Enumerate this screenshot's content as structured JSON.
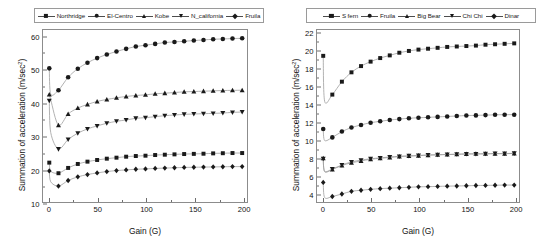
{
  "figure": {
    "panels": [
      "left",
      "right"
    ]
  },
  "chart_data": [
    {
      "panel": "left",
      "type": "line",
      "title": "",
      "xlabel": "Gain (G)",
      "ylabel": "Summation of acceleration (m/sec²)",
      "xlim": [
        -6,
        205
      ],
      "ylim": [
        10,
        62
      ],
      "xticks": [
        0,
        50,
        100,
        150,
        200
      ],
      "xtick_labels": [
        "0",
        "50",
        "100",
        "150",
        "200"
      ],
      "xminor": [
        25,
        75,
        125,
        175
      ],
      "yticks": [
        10,
        20,
        30,
        40,
        50,
        60
      ],
      "ytick_labels": [
        "10",
        "20",
        "30",
        "40",
        "50",
        "60"
      ],
      "yminor": [
        15,
        25,
        35,
        45,
        55
      ],
      "grid": false,
      "legend_position": "above-center",
      "x": [
        0.5,
        2,
        10,
        20,
        30,
        40,
        50,
        60,
        70,
        80,
        90,
        100,
        110,
        120,
        130,
        140,
        150,
        160,
        170,
        180,
        190,
        200
      ],
      "series": [
        {
          "name": "Northridge",
          "marker": "square",
          "values": [
            21.9,
            19.3,
            18.7,
            20.3,
            21.5,
            22.2,
            22.7,
            23.1,
            23.4,
            23.7,
            23.9,
            24.0,
            24.2,
            24.3,
            24.4,
            24.5,
            24.55,
            24.6,
            24.7,
            24.75,
            24.8,
            24.8
          ]
        },
        {
          "name": "El-Centro",
          "marker": "circle",
          "values": [
            50.4,
            42.6,
            43.8,
            47.7,
            50.3,
            52.1,
            53.5,
            54.6,
            55.5,
            56.3,
            57.0,
            57.4,
            57.8,
            58.2,
            58.4,
            58.6,
            58.8,
            59.0,
            59.2,
            59.3,
            59.4,
            59.5
          ]
        },
        {
          "name": "Kobe",
          "marker": "triangle-up",
          "values": [
            42.5,
            40.9,
            33.2,
            36.6,
            38.4,
            39.5,
            40.4,
            41.0,
            41.5,
            41.9,
            42.2,
            42.4,
            42.7,
            42.9,
            43.1,
            43.3,
            43.4,
            43.5,
            43.6,
            43.7,
            43.75,
            43.8
          ]
        },
        {
          "name": "N_california",
          "marker": "triangle-down",
          "values": [
            40.6,
            31.0,
            26.0,
            28.9,
            30.8,
            32.1,
            33.0,
            33.8,
            34.4,
            34.8,
            35.3,
            35.5,
            35.8,
            36.1,
            36.3,
            36.5,
            36.6,
            36.7,
            36.8,
            36.9,
            37.1,
            37.2
          ]
        },
        {
          "name": "Fruila",
          "marker": "diamond",
          "values": [
            19.4,
            16.1,
            14.8,
            16.5,
            17.6,
            18.3,
            18.8,
            19.2,
            19.5,
            19.7,
            19.9,
            20.0,
            20.15,
            20.25,
            20.35,
            20.45,
            20.5,
            20.55,
            20.6,
            20.65,
            20.7,
            20.7
          ]
        }
      ]
    },
    {
      "panel": "right",
      "type": "line",
      "title": "",
      "xlabel": "Gain (G)",
      "ylabel": "Summation of acceleration (m/sec²)",
      "xlim": [
        -6,
        205
      ],
      "ylim": [
        3.0,
        22.3
      ],
      "xticks": [
        0,
        50,
        100,
        150,
        200
      ],
      "xtick_labels": [
        "0",
        "50",
        "100",
        "150",
        "200"
      ],
      "xminor": [
        25,
        75,
        125,
        175
      ],
      "yticks": [
        4,
        6,
        8,
        10,
        12,
        14,
        16,
        18,
        20,
        22
      ],
      "ytick_labels": [
        "4",
        "6",
        "8",
        "10",
        "12",
        "14",
        "16",
        "18",
        "20",
        "22"
      ],
      "yminor": [
        5,
        7,
        9,
        11,
        13,
        15,
        17,
        19,
        21
      ],
      "grid": false,
      "legend_position": "above-center",
      "x": [
        0.5,
        2,
        10,
        20,
        30,
        40,
        50,
        60,
        70,
        80,
        90,
        100,
        110,
        120,
        130,
        140,
        150,
        160,
        170,
        180,
        190,
        200
      ],
      "series": [
        {
          "name": "S fern",
          "marker": "square",
          "values": [
            19.4,
            14.3,
            15.05,
            16.5,
            17.55,
            18.25,
            18.75,
            19.15,
            19.45,
            19.75,
            19.95,
            20.1,
            20.2,
            20.3,
            20.4,
            20.45,
            20.5,
            20.55,
            20.65,
            20.7,
            20.75,
            20.8
          ]
        },
        {
          "name": "Fruila",
          "marker": "circle",
          "values": [
            11.2,
            9.9,
            10.25,
            10.9,
            11.35,
            11.65,
            11.9,
            12.05,
            12.2,
            12.3,
            12.4,
            12.45,
            12.5,
            12.55,
            12.6,
            12.65,
            12.7,
            12.72,
            12.75,
            12.78,
            12.8,
            12.8
          ]
        },
        {
          "name": "Big Bear",
          "marker": "triangle-up",
          "values": [
            7.9,
            6.4,
            6.65,
            7.1,
            7.4,
            7.6,
            7.8,
            7.9,
            8.0,
            8.1,
            8.15,
            8.2,
            8.25,
            8.3,
            8.32,
            8.35,
            8.38,
            8.4,
            8.4,
            8.42,
            8.42,
            8.45
          ]
        },
        {
          "name": "Chi Chi",
          "marker": "triangle-down",
          "values": [
            7.85,
            6.45,
            6.7,
            7.15,
            7.5,
            7.7,
            7.85,
            7.95,
            8.05,
            8.12,
            8.18,
            8.22,
            8.28,
            8.3,
            8.34,
            8.36,
            8.4,
            8.4,
            8.42,
            8.44,
            8.44,
            8.46
          ]
        },
        {
          "name": "Dinar",
          "marker": "diamond",
          "values": [
            5.2,
            3.5,
            3.62,
            3.9,
            4.2,
            4.32,
            4.42,
            4.5,
            4.55,
            4.6,
            4.65,
            4.7,
            4.72,
            4.75,
            4.78,
            4.8,
            4.82,
            4.85,
            4.86,
            4.88,
            4.9,
            4.9
          ]
        }
      ]
    }
  ]
}
